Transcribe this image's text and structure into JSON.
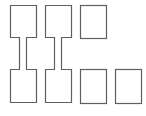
{
  "diagram": {
    "width": 146,
    "height": 116,
    "stroke_color": "#5f5f5f",
    "fill_color": "#ffffff",
    "shapes": [
      {
        "id": "dumbbell-1",
        "type": "dumbbell",
        "top_box": {
          "x": 10,
          "y": 5,
          "w": 26,
          "h": 32
        },
        "connector": {
          "x": 19,
          "w": 7
        },
        "bottom_box": {
          "x": 10,
          "y": 69,
          "w": 26,
          "h": 33
        }
      },
      {
        "id": "dumbbell-2",
        "type": "dumbbell",
        "top_box": {
          "x": 45,
          "y": 5,
          "w": 26,
          "h": 32
        },
        "connector": {
          "x": 54,
          "w": 7
        },
        "bottom_box": {
          "x": 45,
          "y": 69,
          "w": 26,
          "h": 33
        }
      },
      {
        "id": "box-top-right",
        "type": "box",
        "x": 80,
        "y": 5,
        "w": 26,
        "h": 33
      },
      {
        "id": "box-bottom-3",
        "type": "box",
        "x": 80,
        "y": 69,
        "w": 26,
        "h": 34
      },
      {
        "id": "box-bottom-4",
        "type": "box",
        "x": 115,
        "y": 69,
        "w": 26,
        "h": 34
      }
    ]
  }
}
